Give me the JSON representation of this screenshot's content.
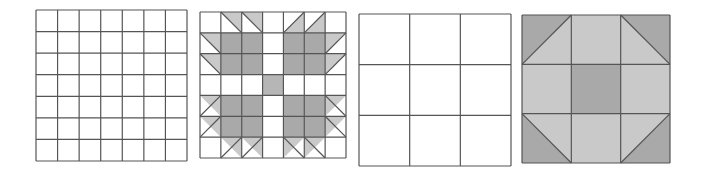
{
  "figure": {
    "colors": {
      "line": "#555555",
      "white": "#ffffff",
      "dark": "#a9a9a9",
      "light": "#c9c9c9",
      "medium": "#b6b6b6"
    },
    "panels": [
      {
        "id": "grid-7x7-empty",
        "x": 35,
        "y": 9,
        "size": 151,
        "divisions": 7,
        "type": "empty-grid"
      },
      {
        "id": "bears-paw-block",
        "x": 199,
        "y": 11,
        "size": 146,
        "divisions": 7,
        "type": "block",
        "cells": [
          [
            "W",
            "T:tl-br:ur",
            "T:tl-br:ur",
            "W",
            "T:bl-tr:lr",
            "T:bl-tr:lr",
            "W"
          ],
          [
            "T:tl-br:ur",
            "D",
            "D",
            "W",
            "D",
            "D",
            "T:bl-tr:ul"
          ],
          [
            "T:tl-br:ur",
            "D",
            "D",
            "W",
            "D",
            "D",
            "T:bl-tr:ul"
          ],
          [
            "W",
            "W",
            "W",
            "M",
            "W",
            "W",
            "W"
          ],
          [
            "T:bl-tr:ur",
            "D",
            "D",
            "W",
            "D",
            "D",
            "T:tl-br:ul"
          ],
          [
            "T:bl-tr:ur",
            "D",
            "D",
            "W",
            "D",
            "D",
            "T:tl-br:ul"
          ],
          [
            "W",
            "T:bl-tr:ur",
            "T:bl-tr:ur",
            "W",
            "T:tl-br:ul",
            "T:tl-br:ul",
            "W"
          ]
        ]
      },
      {
        "id": "grid-3x3-empty",
        "x": 358,
        "y": 13,
        "size": 152,
        "divisions": 3,
        "type": "empty-grid"
      },
      {
        "id": "shoofly-block",
        "x": 521,
        "y": 14,
        "size": 148,
        "divisions": 3,
        "type": "block",
        "cells": [
          [
            "T2:bl-tr:ul",
            "L",
            "T2:tl-br:ur"
          ],
          [
            "L",
            "D",
            "L"
          ],
          [
            "T2:tl-br:ll",
            "L",
            "T2:bl-tr:lr"
          ]
        ]
      }
    ]
  }
}
